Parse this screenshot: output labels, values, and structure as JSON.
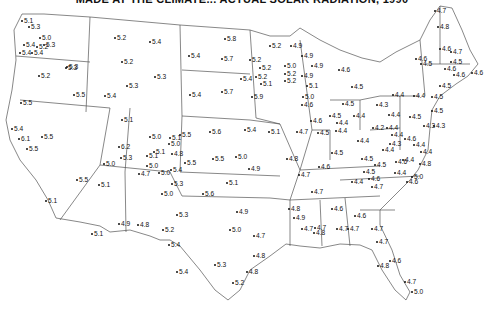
{
  "title": "MADE AT THE CLIMATE... ACTUAL SOLAR RADIATION, 1990",
  "map": {
    "region": "Contiguous United States",
    "colors": {
      "lines": "#555555",
      "text": "#111111",
      "background": "#ffffff"
    },
    "points": [
      {
        "v": "5.1",
        "x": 20,
        "y": 17
      },
      {
        "v": "5.3",
        "x": 27,
        "y": 23
      },
      {
        "v": "5.0",
        "x": 38,
        "y": 34
      },
      {
        "v": "5.4",
        "x": 22,
        "y": 41
      },
      {
        "v": "5.2",
        "x": 35,
        "y": 43
      },
      {
        "v": "5.4",
        "x": 18,
        "y": 49
      },
      {
        "v": "5.4",
        "x": 30,
        "y": 49
      },
      {
        "v": "5.3",
        "x": 64,
        "y": 64
      },
      {
        "v": "5.3",
        "x": 65,
        "y": 63
      },
      {
        "v": "5.2",
        "x": 37,
        "y": 72
      },
      {
        "v": "5.5",
        "x": 19,
        "y": 99
      },
      {
        "v": "5.5",
        "x": 72,
        "y": 91
      },
      {
        "v": "5.4",
        "x": 103,
        "y": 92
      },
      {
        "v": "5.2",
        "x": 113,
        "y": 34
      },
      {
        "v": "5.4",
        "x": 148,
        "y": 38
      },
      {
        "v": "5.2",
        "x": 120,
        "y": 58
      },
      {
        "v": "5.3",
        "x": 153,
        "y": 73
      },
      {
        "v": "5.3",
        "x": 125,
        "y": 82
      },
      {
        "v": "5.1",
        "x": 120,
        "y": 116
      },
      {
        "v": "5.3",
        "x": 42,
        "y": 41
      },
      {
        "v": "5.4",
        "x": 10,
        "y": 125
      },
      {
        "v": "6.1",
        "x": 17,
        "y": 135
      },
      {
        "v": "5.5",
        "x": 25,
        "y": 145
      },
      {
        "v": "5.5",
        "x": 40,
        "y": 133
      },
      {
        "v": "5.5",
        "x": 75,
        "y": 176
      },
      {
        "v": "5.1",
        "x": 44,
        "y": 197
      },
      {
        "v": "6.2",
        "x": 117,
        "y": 143
      },
      {
        "v": "5.3",
        "x": 119,
        "y": 154
      },
      {
        "v": "5.0",
        "x": 102,
        "y": 160
      },
      {
        "v": "5.1",
        "x": 97,
        "y": 181
      },
      {
        "v": "5.0",
        "x": 148,
        "y": 133
      },
      {
        "v": "5.1",
        "x": 168,
        "y": 134
      },
      {
        "v": "5.5",
        "x": 178,
        "y": 131
      },
      {
        "v": "5.0",
        "x": 167,
        "y": 140
      },
      {
        "v": "5.1",
        "x": 152,
        "y": 148
      },
      {
        "v": "5.1",
        "x": 145,
        "y": 152
      },
      {
        "v": "4.8",
        "x": 170,
        "y": 150
      },
      {
        "v": "5.5",
        "x": 183,
        "y": 159
      },
      {
        "v": "5.0",
        "x": 145,
        "y": 162
      },
      {
        "v": "5.0",
        "x": 157,
        "y": 169
      },
      {
        "v": "4.7",
        "x": 137,
        "y": 170
      },
      {
        "v": "5.4",
        "x": 169,
        "y": 166
      },
      {
        "v": "5.3",
        "x": 170,
        "y": 180
      },
      {
        "v": "5.0",
        "x": 160,
        "y": 190
      },
      {
        "v": "5.6",
        "x": 201,
        "y": 190
      },
      {
        "v": "4.9",
        "x": 117,
        "y": 220
      },
      {
        "v": "4.8",
        "x": 136,
        "y": 221
      },
      {
        "v": "5.1",
        "x": 90,
        "y": 230
      },
      {
        "v": "5.2",
        "x": 161,
        "y": 226
      },
      {
        "v": "5.4",
        "x": 167,
        "y": 241
      },
      {
        "v": "5.3",
        "x": 175,
        "y": 211
      },
      {
        "v": "5.4",
        "x": 175,
        "y": 268
      },
      {
        "v": "5.3",
        "x": 213,
        "y": 261
      },
      {
        "v": "5.8",
        "x": 223,
        "y": 35
      },
      {
        "v": "5.4",
        "x": 187,
        "y": 52
      },
      {
        "v": "5.7",
        "x": 220,
        "y": 55
      },
      {
        "v": "5.4",
        "x": 188,
        "y": 91
      },
      {
        "v": "5.7",
        "x": 220,
        "y": 88
      },
      {
        "v": "5.9",
        "x": 250,
        "y": 93
      },
      {
        "v": "5.4",
        "x": 243,
        "y": 126
      },
      {
        "v": "5.6",
        "x": 208,
        "y": 128
      },
      {
        "v": "5.1",
        "x": 267,
        "y": 128
      },
      {
        "v": "5.5",
        "x": 211,
        "y": 155
      },
      {
        "v": "5.0",
        "x": 234,
        "y": 153
      },
      {
        "v": "4.9",
        "x": 247,
        "y": 165
      },
      {
        "v": "5.1",
        "x": 225,
        "y": 179
      },
      {
        "v": "4.9",
        "x": 235,
        "y": 208
      },
      {
        "v": "5.0",
        "x": 228,
        "y": 226
      },
      {
        "v": "4.7",
        "x": 252,
        "y": 232
      },
      {
        "v": "4.8",
        "x": 252,
        "y": 252
      },
      {
        "v": "4.8",
        "x": 245,
        "y": 268
      },
      {
        "v": "5.2",
        "x": 231,
        "y": 279
      },
      {
        "v": "5.2",
        "x": 268,
        "y": 42
      },
      {
        "v": "5.2",
        "x": 248,
        "y": 56
      },
      {
        "v": "5.2",
        "x": 258,
        "y": 64
      },
      {
        "v": "5.2",
        "x": 254,
        "y": 73
      },
      {
        "v": "5.1",
        "x": 259,
        "y": 80
      },
      {
        "v": "5.4",
        "x": 239,
        "y": 75
      },
      {
        "v": "4.9",
        "x": 289,
        "y": 42
      },
      {
        "v": "4.9",
        "x": 300,
        "y": 52
      },
      {
        "v": "5.0",
        "x": 283,
        "y": 62
      },
      {
        "v": "5.2",
        "x": 283,
        "y": 70
      },
      {
        "v": "5.2",
        "x": 283,
        "y": 77
      },
      {
        "v": "4.9",
        "x": 300,
        "y": 72
      },
      {
        "v": "4.9",
        "x": 310,
        "y": 62
      },
      {
        "v": "5.1",
        "x": 305,
        "y": 82
      },
      {
        "v": "5.0",
        "x": 301,
        "y": 93
      },
      {
        "v": "4.6",
        "x": 300,
        "y": 101
      },
      {
        "v": "4.6",
        "x": 337,
        "y": 66
      },
      {
        "v": "4.5",
        "x": 350,
        "y": 83
      },
      {
        "v": "4.5",
        "x": 341,
        "y": 100
      },
      {
        "v": "4.6",
        "x": 309,
        "y": 117
      },
      {
        "v": "4.7",
        "x": 295,
        "y": 128
      },
      {
        "v": "4.5",
        "x": 316,
        "y": 129
      },
      {
        "v": "4.8",
        "x": 285,
        "y": 155
      },
      {
        "v": "4.7",
        "x": 297,
        "y": 171
      },
      {
        "v": "4.5",
        "x": 328,
        "y": 112
      },
      {
        "v": "4.4",
        "x": 335,
        "y": 119
      },
      {
        "v": "4.4",
        "x": 334,
        "y": 127
      },
      {
        "v": "4.4",
        "x": 356,
        "y": 137
      },
      {
        "v": "4.5",
        "x": 330,
        "y": 149
      },
      {
        "v": "4.6",
        "x": 317,
        "y": 163
      },
      {
        "v": "4.5",
        "x": 360,
        "y": 155
      },
      {
        "v": "4.5",
        "x": 362,
        "y": 168
      },
      {
        "v": "4.5",
        "x": 373,
        "y": 161
      },
      {
        "v": "4.6",
        "x": 367,
        "y": 175
      },
      {
        "v": "4.4",
        "x": 350,
        "y": 178
      },
      {
        "v": "4.7",
        "x": 370,
        "y": 183
      },
      {
        "v": "4.7",
        "x": 310,
        "y": 188
      },
      {
        "v": "4.4",
        "x": 352,
        "y": 112
      },
      {
        "v": "4.2",
        "x": 371,
        "y": 124
      },
      {
        "v": "4.4",
        "x": 391,
        "y": 91
      },
      {
        "v": "4.4",
        "x": 387,
        "y": 111
      },
      {
        "v": "4.3",
        "x": 375,
        "y": 101
      },
      {
        "v": "4.4",
        "x": 385,
        "y": 124
      },
      {
        "v": "4.4",
        "x": 390,
        "y": 131
      },
      {
        "v": "4.3",
        "x": 388,
        "y": 140
      },
      {
        "v": "4.4",
        "x": 381,
        "y": 146
      },
      {
        "v": "4.6",
        "x": 403,
        "y": 135
      },
      {
        "v": "4.4",
        "x": 412,
        "y": 141
      },
      {
        "v": "4.4",
        "x": 419,
        "y": 148
      },
      {
        "v": "4.4",
        "x": 401,
        "y": 156
      },
      {
        "v": "4.6",
        "x": 394,
        "y": 158
      },
      {
        "v": "4.5",
        "x": 408,
        "y": 113
      },
      {
        "v": "4.4",
        "x": 412,
        "y": 92
      },
      {
        "v": "4.5",
        "x": 430,
        "y": 93
      },
      {
        "v": "4.5",
        "x": 430,
        "y": 107
      },
      {
        "v": "4.3",
        "x": 422,
        "y": 122
      },
      {
        "v": "4.3",
        "x": 432,
        "y": 122
      },
      {
        "v": "4.8",
        "x": 418,
        "y": 160
      },
      {
        "v": "4.4",
        "x": 393,
        "y": 169
      },
      {
        "v": "5.0",
        "x": 410,
        "y": 173
      },
      {
        "v": "4.6",
        "x": 405,
        "y": 178
      },
      {
        "v": "4.8",
        "x": 287,
        "y": 205
      },
      {
        "v": "4.9",
        "x": 292,
        "y": 214
      },
      {
        "v": "4.7",
        "x": 300,
        "y": 225
      },
      {
        "v": "4.7",
        "x": 313,
        "y": 224
      },
      {
        "v": "4.8",
        "x": 312,
        "y": 229
      },
      {
        "v": "4.6",
        "x": 330,
        "y": 205
      },
      {
        "v": "4.6",
        "x": 353,
        "y": 212
      },
      {
        "v": "4.7",
        "x": 335,
        "y": 225
      },
      {
        "v": "4.7",
        "x": 346,
        "y": 225
      },
      {
        "v": "4.7",
        "x": 370,
        "y": 225
      },
      {
        "v": "4.7",
        "x": 375,
        "y": 238
      },
      {
        "v": "4.8",
        "x": 376,
        "y": 262
      },
      {
        "v": "4.6",
        "x": 388,
        "y": 257
      },
      {
        "v": "4.7",
        "x": 403,
        "y": 278
      },
      {
        "v": "5.0",
        "x": 410,
        "y": 288
      },
      {
        "v": "4.7",
        "x": 433,
        "y": 7
      },
      {
        "v": "4.8",
        "x": 436,
        "y": 23
      },
      {
        "v": "4.7",
        "x": 449,
        "y": 48
      },
      {
        "v": "4.6",
        "x": 414,
        "y": 55
      },
      {
        "v": "4.5",
        "x": 419,
        "y": 60
      },
      {
        "v": "4.6",
        "x": 438,
        "y": 45
      },
      {
        "v": "4.5",
        "x": 449,
        "y": 58
      },
      {
        "v": "4.6",
        "x": 443,
        "y": 65
      },
      {
        "v": "4.6",
        "x": 452,
        "y": 71
      },
      {
        "v": "4.6",
        "x": 470,
        "y": 69
      },
      {
        "v": "4.5",
        "x": 438,
        "y": 82
      }
    ]
  }
}
